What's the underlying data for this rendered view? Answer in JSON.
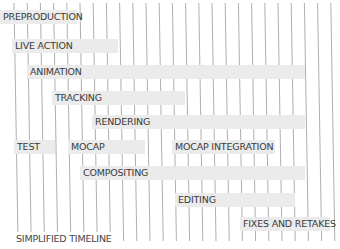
{
  "chart_data": {
    "type": "gantt",
    "title": "SIMPLIFIED TIMELINE",
    "xlabel": "",
    "ylabel": "",
    "grid": true,
    "grid_lines": 25,
    "tasks": [
      {
        "name": "PREPRODUCTION",
        "x_start": 0,
        "x_end": 77,
        "row": 0
      },
      {
        "name": "LIVE ACTION",
        "x_start": 12,
        "x_end": 118,
        "row": 1
      },
      {
        "name": "ANIMATION",
        "x_start": 27,
        "x_end": 305,
        "row": 2
      },
      {
        "name": "TRACKING",
        "x_start": 52,
        "x_end": 185,
        "row": 3
      },
      {
        "name": "RENDERING",
        "x_start": 92,
        "x_end": 305,
        "row": 4
      },
      {
        "name": "TEST",
        "x_start": 14,
        "x_end": 55,
        "row": 5
      },
      {
        "name": "MOCAP",
        "x_start": 68,
        "x_end": 145,
        "row": 5
      },
      {
        "name": "MOCAP INTEGRATION",
        "x_start": 172,
        "x_end": 275,
        "row": 5
      },
      {
        "name": "COMPOSITING",
        "x_start": 80,
        "x_end": 305,
        "row": 6
      },
      {
        "name": "EDITING",
        "x_start": 175,
        "x_end": 295,
        "row": 7
      },
      {
        "name": "FIXES AND RETAKES",
        "x_start": 240,
        "x_end": 330,
        "row": 8
      }
    ]
  },
  "rows_y": [
    10,
    39,
    65,
    91,
    115,
    140,
    166,
    193,
    217
  ],
  "footer": "SIMPLIFIED TIMELINE",
  "colors": {
    "bar": "#ebebeb",
    "grid": "#9a9a9a",
    "text": "#3a3a3a"
  }
}
